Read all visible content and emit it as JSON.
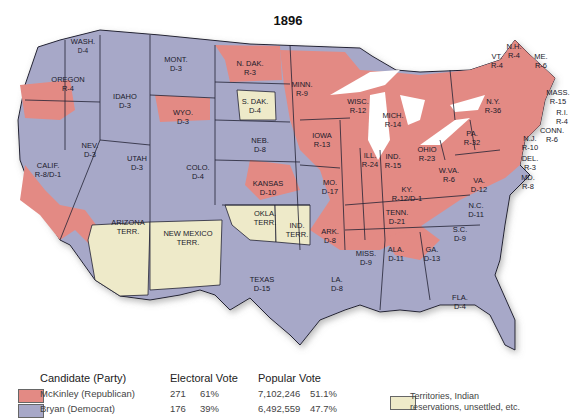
{
  "title": "1896",
  "colors": {
    "republican": "#e38a84",
    "democrat": "#a7a8c8",
    "territory": "#eeeac9",
    "lakes": "#ffffff",
    "border": "#222233"
  },
  "states": [
    {
      "name": "WASH.",
      "result": "D-4"
    },
    {
      "name": "OREGON",
      "result": "R-4"
    },
    {
      "name": "CALIF.",
      "result": "R-8/D-1"
    },
    {
      "name": "IDAHO",
      "result": "D-3"
    },
    {
      "name": "NEV.",
      "result": "D-3"
    },
    {
      "name": "MONT.",
      "result": "D-3"
    },
    {
      "name": "WYO.",
      "result": "D-3"
    },
    {
      "name": "UTAH",
      "result": "D-3"
    },
    {
      "name": "COLO.",
      "result": "D-4"
    },
    {
      "name": "ARIZONA TERR.",
      "result": ""
    },
    {
      "name": "NEW MEXICO TERR.",
      "result": ""
    },
    {
      "name": "N. DAK.",
      "result": "R-3"
    },
    {
      "name": "S. DAK.",
      "result": "D-4"
    },
    {
      "name": "NEB.",
      "result": "D-8"
    },
    {
      "name": "KANSAS",
      "result": "D-10"
    },
    {
      "name": "OKLA. TERR.",
      "result": ""
    },
    {
      "name": "IND. TERR.",
      "result": ""
    },
    {
      "name": "TEXAS",
      "result": "D-15"
    },
    {
      "name": "MINN.",
      "result": "R-9"
    },
    {
      "name": "IOWA",
      "result": "R-13"
    },
    {
      "name": "MO.",
      "result": "D-17"
    },
    {
      "name": "ARK.",
      "result": "D-8"
    },
    {
      "name": "LA.",
      "result": "D-8"
    },
    {
      "name": "WISC.",
      "result": "R-12"
    },
    {
      "name": "ILL.",
      "result": "R-24"
    },
    {
      "name": "MICH.",
      "result": "R-14"
    },
    {
      "name": "IND.",
      "result": "R-15"
    },
    {
      "name": "OHIO",
      "result": "R-23"
    },
    {
      "name": "KY.",
      "result": "R-12/D-1"
    },
    {
      "name": "TENN.",
      "result": "D-21"
    },
    {
      "name": "MISS.",
      "result": "D-9"
    },
    {
      "name": "ALA.",
      "result": "D-11"
    },
    {
      "name": "GA.",
      "result": "D-13"
    },
    {
      "name": "FLA.",
      "result": "D-4"
    },
    {
      "name": "S.C.",
      "result": "D-9"
    },
    {
      "name": "N.C.",
      "result": "D-11"
    },
    {
      "name": "VA.",
      "result": "D-12"
    },
    {
      "name": "W.VA.",
      "result": "R-6"
    },
    {
      "name": "PA.",
      "result": "R-32"
    },
    {
      "name": "N.Y.",
      "result": "R-36"
    },
    {
      "name": "VT.",
      "result": "R-4"
    },
    {
      "name": "N.H.",
      "result": "R-4"
    },
    {
      "name": "ME.",
      "result": "R-6"
    },
    {
      "name": "MASS.",
      "result": "R-15"
    },
    {
      "name": "R.I.",
      "result": "R-4"
    },
    {
      "name": "CONN.",
      "result": "R-6"
    },
    {
      "name": "N.J.",
      "result": "R-10"
    },
    {
      "name": "DEL.",
      "result": "R-3"
    },
    {
      "name": "MD.",
      "result": "R-8"
    }
  ],
  "legend": {
    "header_candidate": "Candidate (Party)",
    "header_electoral": "Electoral Vote",
    "header_popular": "Popular Vote",
    "rows": [
      {
        "candidate": "McKinley (Republican)",
        "electoral": "271",
        "electoral_pct": "61%",
        "popular": "7,102,246",
        "popular_pct": "51.1%"
      },
      {
        "candidate": "Bryan (Democrat)",
        "electoral": "176",
        "electoral_pct": "39%",
        "popular": "6,492,559",
        "popular_pct": "47.7%"
      }
    ],
    "territory_line1": "Territories, Indian",
    "territory_line2": "reservations, unsettled, etc."
  }
}
